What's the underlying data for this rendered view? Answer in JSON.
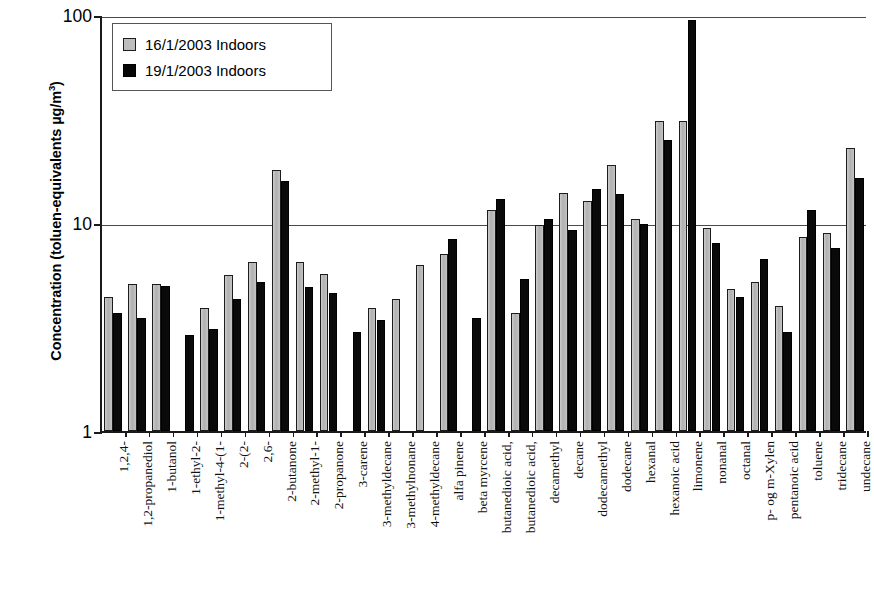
{
  "chart_data": {
    "type": "bar",
    "title": "",
    "xlabel": "",
    "ylabel": "Concentration (toluen-equivalents µg/m³)",
    "yscale": "log",
    "ylim": [
      1,
      100
    ],
    "ytick_labels": [
      "100",
      "10",
      "1"
    ],
    "ytick_values": [
      100,
      10,
      1
    ],
    "grid": "horizontal-major-only",
    "legend_position": "top-left-inside",
    "categories": [
      "1,2,4-",
      "1,2-propanediol",
      "1-butanol",
      "1-ethyl-2-",
      "1-methyl-4-(1-",
      "2-(2-",
      "2,6-",
      "2-butanone",
      "2-methyl-1-",
      "2-propanone",
      "3-carene",
      "3-methyldecane",
      "3-methylnonane",
      "4-methyldecane",
      "alfa pinene",
      "beta myrcene",
      "butanedioic acid,",
      "butanedioic acid,",
      "decamethyl",
      "decane",
      "dodecamethyl",
      "dodecane",
      "hexanal",
      "hexanoic acid",
      "limonene",
      "nonanal",
      "octanal",
      "p- og m-Xylen",
      "pentanoic acid",
      "toluene",
      "tridecane",
      "undecane"
    ],
    "series": [
      {
        "name": "16/1/2003 Indoors",
        "color": "#bdbdbd",
        "values": [
          4.4,
          5.1,
          5.1,
          null,
          3.9,
          5.6,
          6.5,
          18.0,
          6.5,
          5.7,
          null,
          3.9,
          4.3,
          6.3,
          7.1,
          null,
          11.5,
          3.7,
          9.8,
          14.0,
          12.8,
          19.0,
          10.4,
          31.0,
          31.0,
          9.5,
          4.8,
          5.2,
          4.0,
          8.6,
          9.0,
          23.0
        ]
      },
      {
        "name": "19/1/2003 Indoors",
        "color": "#070707",
        "values": [
          3.7,
          3.5,
          5.0,
          2.9,
          3.1,
          4.3,
          5.2,
          16.0,
          4.9,
          4.6,
          3.0,
          3.4,
          null,
          null,
          8.4,
          3.5,
          13.0,
          5.4,
          10.5,
          9.3,
          14.5,
          13.8,
          9.9,
          25.0,
          95.0,
          8.0,
          4.4,
          6.7,
          3.0,
          11.6,
          7.6,
          16.5
        ]
      }
    ]
  },
  "legend": {
    "entries": [
      {
        "label": "16/1/2003 Indoors"
      },
      {
        "label": "19/1/2003 Indoors"
      }
    ]
  },
  "axis": {
    "y_title_main": "Concentration (toluen-equivalents µg/m",
    "y_title_sup": "3",
    "y_title_close": ")"
  }
}
